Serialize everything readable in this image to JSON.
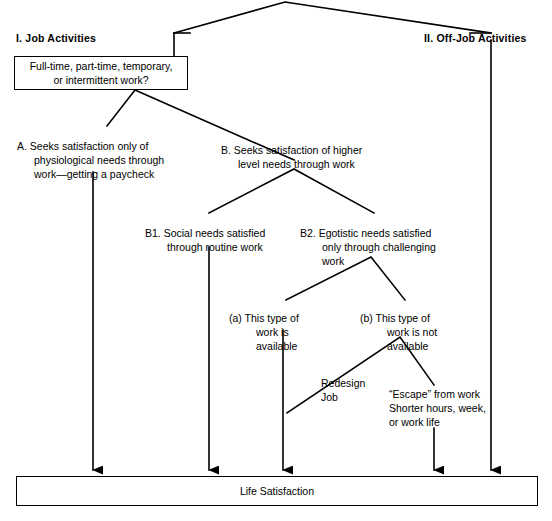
{
  "diagram": {
    "line_color": "#000000",
    "background_color": "#ffffff",
    "top_branches": [
      {
        "id": "I",
        "label": "I.  Job Activities"
      },
      {
        "id": "II",
        "label": "II.  Off-Job Activities"
      }
    ],
    "question_box": {
      "text": "Full-time, part-time, temporary,\nor intermittent work?"
    },
    "branch_a": {
      "label": "A.  Seeks satisfaction only of\nphysiological needs through\nwork—getting a paycheck"
    },
    "branch_b": {
      "label": "B.  Seeks satisfaction of higher\nlevel needs through work"
    },
    "branch_b1": {
      "label": "B1.  Social needs satisfied\nthrough routine work"
    },
    "branch_b2": {
      "label": "B2.  Egotistic needs satisfied\nonly through challenging\nwork"
    },
    "leaf_a": {
      "label": "(a)  This type of\nwork is\navailable"
    },
    "leaf_b": {
      "label": "(b)  This type of\nwork is not\navailable"
    },
    "redesign": {
      "label": "Redesign\nJob"
    },
    "escape": {
      "label": "“Escape” from work\nShorter hours, week,\nor work life"
    },
    "outcome_box": {
      "label": "Life Satisfaction"
    }
  }
}
